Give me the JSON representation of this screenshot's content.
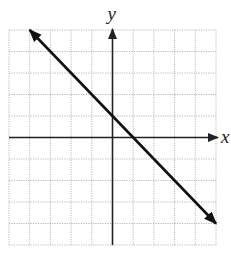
{
  "chart_data": {
    "type": "line",
    "title": "",
    "xlabel": "x",
    "ylabel": "y",
    "xlim": [
      -5,
      5
    ],
    "ylim": [
      -5,
      5
    ],
    "grid": true,
    "grid_step": 1,
    "tick_labels": false,
    "series": [
      {
        "name": "line",
        "equation": "y = -x + 1",
        "slope": -1,
        "y_intercept": 1,
        "x_intercept": 1,
        "points": [
          [
            -4,
            5
          ],
          [
            0,
            1
          ],
          [
            1,
            0
          ],
          [
            5,
            -4
          ]
        ],
        "arrows": "both"
      }
    ]
  },
  "labels": {
    "x_axis": "x",
    "y_axis": "y"
  },
  "colors": {
    "grid": "#b8b8b8",
    "axis": "#222222",
    "line": "#111111",
    "background": "#ffffff"
  }
}
